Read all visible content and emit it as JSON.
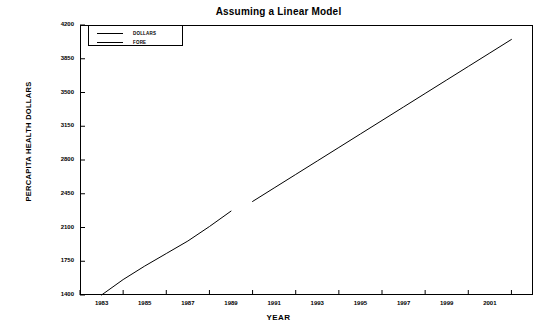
{
  "chart_data": {
    "type": "line",
    "title": "Assuming a Linear Model",
    "xlabel": "YEAR",
    "ylabel": "PERCAPITA HEALTH DOLLARS",
    "xlim": [
      1982,
      2003
    ],
    "ylim": [
      1400,
      4200
    ],
    "grid": false,
    "legend_position": "top-left-inside",
    "x_ticks": [
      1983,
      1985,
      1987,
      1989,
      1991,
      1993,
      1995,
      1997,
      1999,
      2001
    ],
    "x_tick_labels": [
      "1983",
      "1985",
      "1987",
      "1989",
      "1991",
      "1993",
      "1995",
      "1997",
      "1999",
      "2001"
    ],
    "x_minor_ticks": [
      1982,
      1984,
      1986,
      1988,
      1990,
      1992,
      1994,
      1996,
      1998,
      2000,
      2002
    ],
    "y_ticks": [
      1400,
      1750,
      2100,
      2450,
      2800,
      3150,
      3500,
      3850,
      4200
    ],
    "y_tick_labels": [
      "1400",
      "1750",
      "2100",
      "2450",
      "2800",
      "3150",
      "3500",
      "3850",
      "4200"
    ],
    "series": [
      {
        "name": "DOLLARS",
        "color": "#000000",
        "x": [
          1983,
          1984,
          1985,
          1986,
          1987,
          1988,
          1989
        ],
        "values": [
          1400,
          1560,
          1700,
          1830,
          1960,
          2110,
          2270
        ]
      },
      {
        "name": "FORE",
        "color": "#000000",
        "x": [
          1990,
          1991,
          1992,
          1993,
          1994,
          1995,
          1996,
          1997,
          1998,
          1999,
          2000,
          2001,
          2002
        ],
        "values": [
          2370,
          2510,
          2650,
          2790,
          2930,
          3070,
          3210,
          3350,
          3490,
          3630,
          3770,
          3910,
          4050
        ]
      }
    ]
  },
  "legend": {
    "entries": [
      {
        "label": "DOLLARS"
      },
      {
        "label": "FORE"
      }
    ]
  }
}
